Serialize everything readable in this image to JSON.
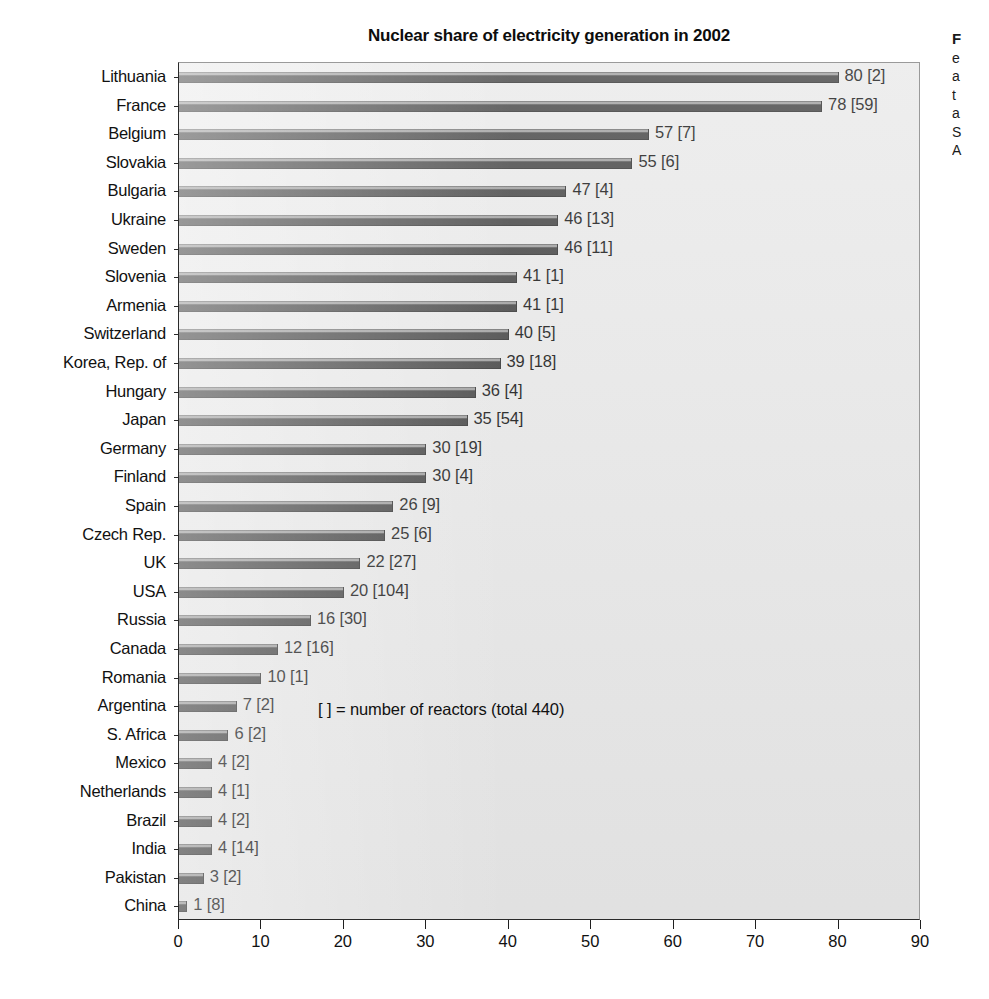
{
  "chart_data": {
    "type": "bar",
    "orientation": "horizontal",
    "title": "Nuclear share of electricity generation in 2002",
    "xlabel": "",
    "ylabel": "",
    "xlim": [
      0,
      90
    ],
    "xticks": [
      0,
      10,
      20,
      30,
      40,
      50,
      60,
      70,
      80,
      90
    ],
    "grid": false,
    "legend": false,
    "annotation": "[ ] = number of reactors (total 440)",
    "value_label_format": "{value} [{reactors}]",
    "categories": [
      "Lithuania",
      "France",
      "Belgium",
      "Slovakia",
      "Bulgaria",
      "Ukraine",
      "Sweden",
      "Slovenia",
      "Armenia",
      "Switzerland",
      "Korea, Rep. of",
      "Hungary",
      "Japan",
      "Germany",
      "Finland",
      "Spain",
      "Czech Rep.",
      "UK",
      "USA",
      "Russia",
      "Canada",
      "Romania",
      "Argentina",
      "S. Africa",
      "Mexico",
      "Netherlands",
      "Brazil",
      "India",
      "Pakistan",
      "China"
    ],
    "values": [
      80,
      78,
      57,
      55,
      47,
      46,
      46,
      41,
      41,
      40,
      39,
      36,
      35,
      30,
      30,
      26,
      25,
      22,
      20,
      16,
      12,
      10,
      7,
      6,
      4,
      4,
      4,
      4,
      3,
      1
    ],
    "reactors": [
      2,
      59,
      7,
      6,
      4,
      13,
      11,
      1,
      1,
      5,
      18,
      4,
      54,
      19,
      4,
      9,
      6,
      27,
      104,
      30,
      16,
      1,
      2,
      2,
      2,
      1,
      2,
      14,
      2,
      8
    ],
    "rows": [
      {
        "category": "Lithuania",
        "value": 80,
        "reactors": 2,
        "label": "80 [2]"
      },
      {
        "category": "France",
        "value": 78,
        "reactors": 59,
        "label": "78 [59]"
      },
      {
        "category": "Belgium",
        "value": 57,
        "reactors": 7,
        "label": "57 [7]"
      },
      {
        "category": "Slovakia",
        "value": 55,
        "reactors": 6,
        "label": "55 [6]"
      },
      {
        "category": "Bulgaria",
        "value": 47,
        "reactors": 4,
        "label": "47 [4]"
      },
      {
        "category": "Ukraine",
        "value": 46,
        "reactors": 13,
        "label": "46 [13]"
      },
      {
        "category": "Sweden",
        "value": 46,
        "reactors": 11,
        "label": "46 [11]"
      },
      {
        "category": "Slovenia",
        "value": 41,
        "reactors": 1,
        "label": "41 [1]"
      },
      {
        "category": "Armenia",
        "value": 41,
        "reactors": 1,
        "label": "41 [1]"
      },
      {
        "category": "Switzerland",
        "value": 40,
        "reactors": 5,
        "label": "40 [5]"
      },
      {
        "category": "Korea, Rep. of",
        "value": 39,
        "reactors": 18,
        "label": "39 [18]"
      },
      {
        "category": "Hungary",
        "value": 36,
        "reactors": 4,
        "label": "36 [4]"
      },
      {
        "category": "Japan",
        "value": 35,
        "reactors": 54,
        "label": "35 [54]"
      },
      {
        "category": "Germany",
        "value": 30,
        "reactors": 19,
        "label": "30 [19]"
      },
      {
        "category": "Finland",
        "value": 30,
        "reactors": 4,
        "label": "30 [4]"
      },
      {
        "category": "Spain",
        "value": 26,
        "reactors": 9,
        "label": "26 [9]"
      },
      {
        "category": "Czech Rep.",
        "value": 25,
        "reactors": 6,
        "label": "25 [6]"
      },
      {
        "category": "UK",
        "value": 22,
        "reactors": 27,
        "label": "22 [27]"
      },
      {
        "category": "USA",
        "value": 20,
        "reactors": 104,
        "label": "20 [104]"
      },
      {
        "category": "Russia",
        "value": 16,
        "reactors": 30,
        "label": "16 [30]"
      },
      {
        "category": "Canada",
        "value": 12,
        "reactors": 16,
        "label": "12 [16]"
      },
      {
        "category": "Romania",
        "value": 10,
        "reactors": 1,
        "label": "10 [1]"
      },
      {
        "category": "Argentina",
        "value": 7,
        "reactors": 2,
        "label": "7 [2]"
      },
      {
        "category": "S. Africa",
        "value": 6,
        "reactors": 2,
        "label": "6 [2]"
      },
      {
        "category": "Mexico",
        "value": 4,
        "reactors": 2,
        "label": "4 [2]"
      },
      {
        "category": "Netherlands",
        "value": 4,
        "reactors": 1,
        "label": "4 [1]"
      },
      {
        "category": "Brazil",
        "value": 4,
        "reactors": 2,
        "label": "4 [2]"
      },
      {
        "category": "India",
        "value": 4,
        "reactors": 14,
        "label": "4 [14]"
      },
      {
        "category": "Pakistan",
        "value": 3,
        "reactors": 2,
        "label": "3 [2]"
      },
      {
        "category": "China",
        "value": 1,
        "reactors": 8,
        "label": "1 [8]"
      }
    ]
  },
  "side_caption": {
    "lead": "F",
    "lines": [
      "e",
      "a",
      "t",
      "a",
      "S",
      "A"
    ]
  },
  "colors": {
    "plot_background": "#e9e9e9",
    "bar_fill": "#464646",
    "bar_highlight": "#9d9d9d",
    "axis": "#2a2a2a",
    "text": "#111111",
    "page_background": "#ffffff"
  }
}
